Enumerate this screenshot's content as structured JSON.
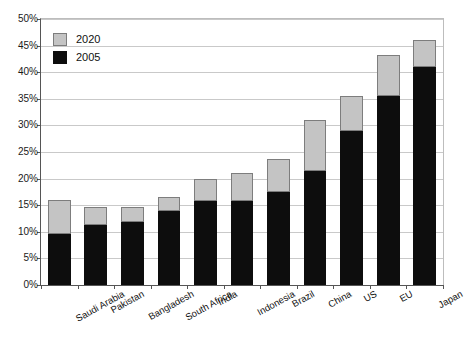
{
  "chart_data": {
    "type": "bar",
    "stacked": true,
    "title": "",
    "subtitle": "",
    "xlabel": "",
    "ylabel": "",
    "ylim": [
      0,
      50
    ],
    "ytick_step": 5,
    "ytick_labels": [
      "0%",
      "5%",
      "10%",
      "15%",
      "20%",
      "25%",
      "30%",
      "35%",
      "40%",
      "45%",
      "50%"
    ],
    "ytick_values": [
      0,
      5,
      10,
      15,
      20,
      25,
      30,
      35,
      40,
      45,
      50
    ],
    "grid": true,
    "legend_position": "top-left",
    "categories": [
      "Saudi Arabia",
      "Pakistan",
      "Bangladesh",
      "South Africa",
      "India",
      "Indonesia",
      "Brazil",
      "China",
      "US",
      "EU",
      "Japan"
    ],
    "series": [
      {
        "name": "2005",
        "color": "#0d0d0d",
        "values": [
          9.5,
          11.2,
          11.8,
          14.0,
          15.8,
          15.7,
          17.5,
          21.5,
          29.0,
          35.5,
          41.0
        ]
      },
      {
        "name": "2020",
        "color": "#c4c4c4",
        "values": [
          16.0,
          14.7,
          14.7,
          16.5,
          20.0,
          21.0,
          23.7,
          31.0,
          35.5,
          43.2,
          46.0
        ]
      }
    ],
    "totals": [
      16.0,
      14.7,
      14.7,
      16.5,
      20.0,
      21.0,
      23.7,
      31.0,
      35.5,
      43.2,
      46.0
    ],
    "note": "2020 values are cumulative bar tops; the gray segment is the increment above the 2005 black segment."
  },
  "legend": {
    "items": [
      {
        "label": "2020",
        "color": "#c4c4c4",
        "swatch": "legend-swatch-2020"
      },
      {
        "label": "2005",
        "color": "#0d0d0d",
        "swatch": "legend-swatch-2005"
      }
    ]
  },
  "colors": {
    "series_2020": "#c4c4c4",
    "series_2020_border": "#7d7d7d",
    "series_2005": "#0d0d0d",
    "gridline": "#c9c9c9",
    "axis": "#555555",
    "background": "#ffffff",
    "text": "#111111"
  }
}
